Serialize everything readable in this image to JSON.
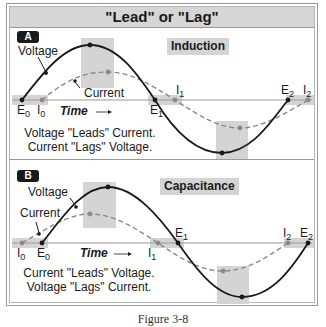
{
  "title": "\"Lead\" or \"Lag\"",
  "caption": "Figure 3-8",
  "panels": [
    {
      "badge": "A",
      "name": "Induction",
      "curve_labels": {
        "voltage": "Voltage",
        "current": "Current"
      },
      "axis_label": "Time",
      "axis_arrow": "→",
      "points": {
        "E0": {
          "main": "E",
          "sub": "0"
        },
        "I0": {
          "main": "I",
          "sub": "0"
        },
        "E1": {
          "main": "E",
          "sub": "1"
        },
        "I1": {
          "main": "I",
          "sub": "1"
        },
        "E2": {
          "main": "E",
          "sub": "2"
        },
        "I2": {
          "main": "I",
          "sub": "2"
        }
      },
      "statement_line1": "Voltage \"Leads\" Current.",
      "statement_line2": "Current \"Lags\" Voltage."
    },
    {
      "badge": "B",
      "name": "Capacitance",
      "curve_labels": {
        "voltage": "Voltage",
        "current": "Current"
      },
      "axis_label": "Time",
      "axis_arrow": "→",
      "points": {
        "I0": {
          "main": "I",
          "sub": "0"
        },
        "E0": {
          "main": "E",
          "sub": "0"
        },
        "I1": {
          "main": "I",
          "sub": "1"
        },
        "E1": {
          "main": "E",
          "sub": "1"
        },
        "I2": {
          "main": "I",
          "sub": "2"
        },
        "E2": {
          "main": "E",
          "sub": "2"
        }
      },
      "statement_line1": "Current \"Leads\" Voltage.",
      "statement_line2": "Voltage \"Lags\" Current."
    }
  ],
  "colors": {
    "voltage_line": "#1a1a1a",
    "current_line": "#8a8a8a",
    "highlight": "#d4d4d4",
    "axis": "#9a9a9a"
  }
}
